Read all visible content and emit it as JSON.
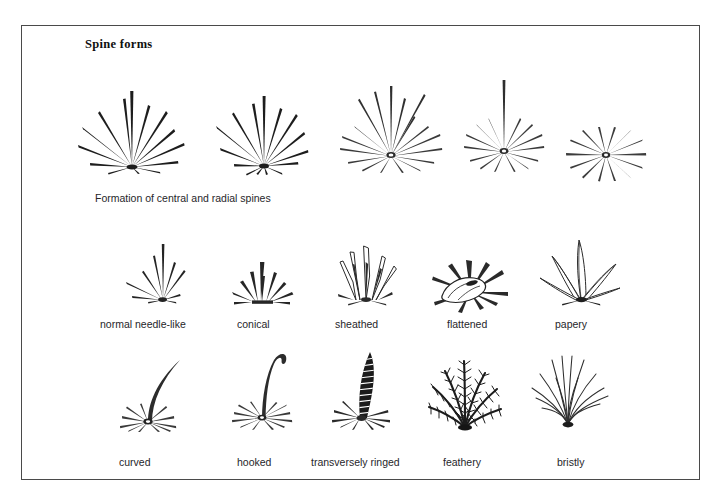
{
  "page": {
    "background_color": "#ffffff",
    "ink_color": "#1a1a1a",
    "frame_color": "#4a4a4a"
  },
  "title": "Spine forms",
  "rows": [
    {
      "id": "central-and-radial-formation",
      "caption": "Formation of central and radial spines",
      "figures": [
        {
          "name": "many-centrals-wide-spray",
          "centrals": 7,
          "radials": 8
        },
        {
          "name": "fewer-centrals-spray",
          "centrals": 6,
          "radials": 9
        },
        {
          "name": "few-centrals-many-radials",
          "centrals": 5,
          "radials": 12
        },
        {
          "name": "single-central-many-radials",
          "centrals": 1,
          "radials": 13
        },
        {
          "name": "radials-only",
          "centrals": 0,
          "radials": 14
        }
      ]
    },
    {
      "id": "spine-shapes",
      "figures": [
        {
          "name": "normal-needle-like",
          "label": "normal  needle-like"
        },
        {
          "name": "conical",
          "label": "conical"
        },
        {
          "name": "sheathed",
          "label": "sheathed"
        },
        {
          "name": "flattened",
          "label": "flattened"
        },
        {
          "name": "papery",
          "label": "papery"
        }
      ]
    },
    {
      "id": "spine-surfaces-and-curvature",
      "figures": [
        {
          "name": "curved",
          "label": "curved"
        },
        {
          "name": "hooked",
          "label": "hooked"
        },
        {
          "name": "transversely-ringed",
          "label": "transversely ringed"
        },
        {
          "name": "feathery",
          "label": "feathery"
        },
        {
          "name": "bristly",
          "label": "bristly"
        }
      ]
    }
  ]
}
